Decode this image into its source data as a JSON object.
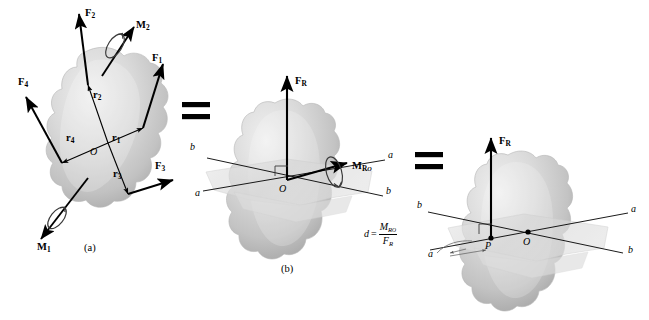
{
  "figure": {
    "relation_symbol": "=",
    "panel_a_label": "(a)",
    "panel_b_label": "(b)"
  },
  "colors": {
    "ink": "#000000",
    "body_light": "#e4e4e4",
    "body_mid": "#c9c9c9",
    "body_dark": "#a9a9a9",
    "plane_fill": "#dcdcdc",
    "background": "#ffffff"
  },
  "panel_a": {
    "label": "(a)",
    "origin_label": "O",
    "forces": [
      {
        "name": "F1",
        "base": "F",
        "sub": "1"
      },
      {
        "name": "F2",
        "base": "F",
        "sub": "2"
      },
      {
        "name": "F3",
        "base": "F",
        "sub": "3"
      },
      {
        "name": "F4",
        "base": "F",
        "sub": "4"
      }
    ],
    "position_vectors": [
      {
        "name": "r1",
        "base": "r",
        "sub": "1"
      },
      {
        "name": "r2",
        "base": "r",
        "sub": "2"
      },
      {
        "name": "r3",
        "base": "r",
        "sub": "3"
      },
      {
        "name": "r4",
        "base": "r",
        "sub": "4"
      }
    ],
    "couple_moments": [
      {
        "name": "M1",
        "base": "M",
        "sub": "1"
      },
      {
        "name": "M2",
        "base": "M",
        "sub": "2"
      }
    ]
  },
  "panel_b": {
    "label": "(b)",
    "origin_label": "O",
    "resultant_force": {
      "base": "F",
      "sub": "R"
    },
    "resultant_moment": {
      "base": "M",
      "sub": "R",
      "subsub": "O"
    },
    "axis_labels": {
      "upper_left": "b",
      "upper_right": "a",
      "lower_left": "a",
      "lower_right": "b"
    }
  },
  "panel_c": {
    "origin_label": "O",
    "point_label": "P",
    "resultant_force": {
      "base": "F",
      "sub": "R"
    },
    "distance_equation": {
      "lhs": "d",
      "equals": "=",
      "numerator_base": "M",
      "numerator_sub": "R",
      "numerator_subsub": "O",
      "denominator_base": "F",
      "denominator_sub": "R"
    },
    "axis_labels": {
      "upper_left": "b",
      "upper_right": "a",
      "lower_left": "a",
      "lower_right": "b"
    }
  }
}
